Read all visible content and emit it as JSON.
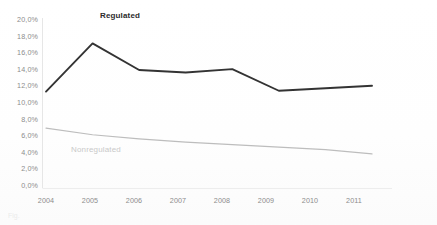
{
  "chart_data": {
    "type": "line",
    "title": "",
    "xlabel": "",
    "ylabel": "",
    "x": [
      2004,
      2005,
      2006,
      2007,
      2008,
      2009,
      2010,
      2011
    ],
    "categories": [
      "2004",
      "2005",
      "2006",
      "2007",
      "2008",
      "2009",
      "2010",
      "2011"
    ],
    "ylim": [
      0,
      20
    ],
    "ytick_labels": [
      "20,0%",
      "18,0%",
      "16,0%",
      "14,0%",
      "12,0%",
      "10,0%",
      "8,0%",
      "6,0%",
      "4,0%",
      "2,0%",
      "0,0%"
    ],
    "ytick_values": [
      20,
      18,
      16,
      14,
      12,
      10,
      8,
      6,
      4,
      2,
      0
    ],
    "grid": false,
    "legend_position": "inline-annotation",
    "series": [
      {
        "name": "Regulated",
        "color": "#333333",
        "values": [
          11.4,
          17.2,
          14.0,
          13.7,
          14.1,
          11.5,
          11.8,
          12.1
        ]
      },
      {
        "name": "Nonregulated",
        "color": "#bdbdbd",
        "values": [
          7.0,
          6.2,
          5.7,
          5.3,
          5.0,
          4.7,
          4.4,
          3.9
        ]
      }
    ],
    "annotations": [
      {
        "text": "Regulated",
        "series": "Regulated"
      },
      {
        "text": "Nonregulated",
        "series": "Nonregulated"
      }
    ]
  },
  "axis": {
    "axis_line_color": "#e2e2e2",
    "tick_text_color": "#8c8c8c"
  },
  "caption_remnant": "Fig."
}
